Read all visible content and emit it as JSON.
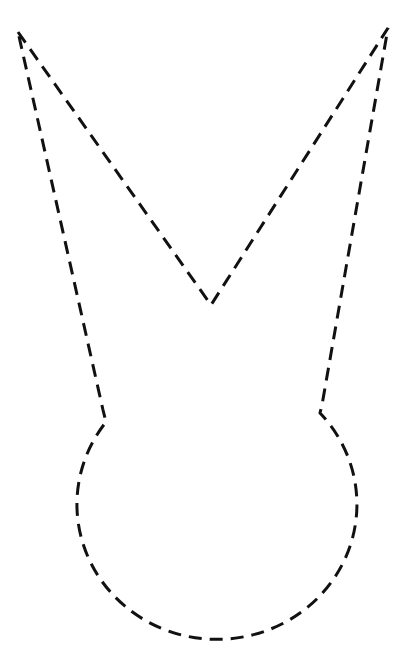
{
  "figure": {
    "background_color": "#ffffff",
    "stroke_color": "#111111",
    "stroke_width": 3,
    "dash_pattern": "13 8",
    "vertices": {
      "top_left_tip": [
        18,
        32
      ],
      "v_notch": [
        211,
        305
      ],
      "top_right_tip": [
        388,
        28
      ],
      "right_junction": [
        320,
        413
      ],
      "left_junction": [
        106,
        422
      ]
    },
    "junction_inner_points": {
      "right": [
        322,
        405
      ],
      "left": [
        103,
        410
      ]
    },
    "body_arc": {
      "rx": 140,
      "ry": 135,
      "approx_center": [
        215,
        520
      ],
      "bottom_y": 653,
      "left_extreme_x": 75,
      "right_extreme_x": 355
    }
  }
}
